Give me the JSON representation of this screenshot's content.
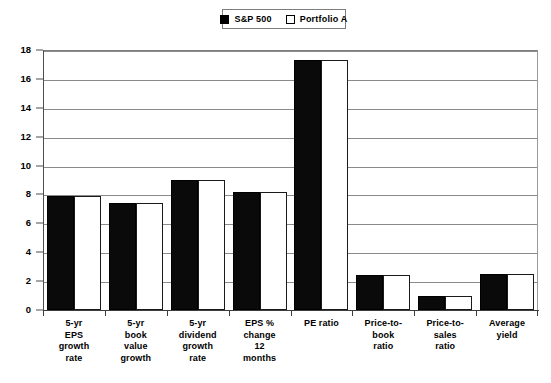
{
  "legend": {
    "position": "top-center",
    "entries": [
      {
        "label": "S&P 500",
        "swatch": "filled-black-square",
        "color": "#000000"
      },
      {
        "label": "Portfolio A",
        "swatch": "outlined-white-square",
        "color": "#ffffff"
      }
    ]
  },
  "axis": {
    "y_ticks": [
      "0",
      "2",
      "4",
      "6",
      "8",
      "10",
      "12",
      "14",
      "16",
      "18"
    ]
  },
  "chart_data": {
    "type": "bar",
    "title": "",
    "subtitle": "",
    "xlabel": "",
    "ylabel": "",
    "ylim": [
      0,
      18
    ],
    "ytick_step": 2,
    "grid": true,
    "legend_position": "top-center",
    "categories": [
      "5-yr\nEPS\ngrowth\nrate",
      "5-yr\nbook\nvalue\ngrowth",
      "5-yr\ndividend\ngrowth\nrate",
      "EPS %\nchange\n12\nmonths",
      "PE  ratio",
      "Price-to-\nbook\nratio",
      "Price-to-\nsales\nratio",
      "Average\nyield"
    ],
    "series": [
      {
        "name": "S&P 500",
        "color": "#000000",
        "values": [
          7.9,
          7.4,
          9.0,
          8.2,
          17.3,
          2.4,
          1.0,
          2.5
        ]
      },
      {
        "name": "Portfolio A",
        "color": "#ffffff",
        "values": [
          7.9,
          7.4,
          9.0,
          8.2,
          17.3,
          2.4,
          1.0,
          2.5
        ]
      }
    ]
  }
}
